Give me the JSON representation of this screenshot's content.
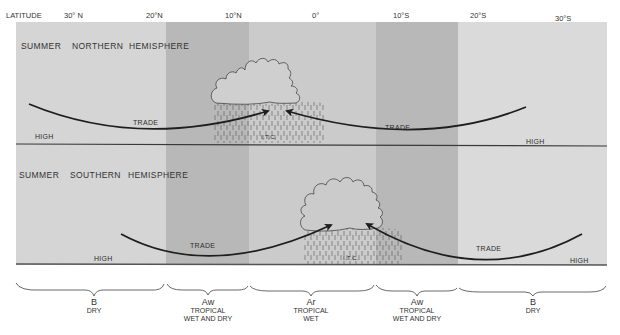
{
  "latitude_axis": {
    "label": "LATITUDE",
    "ticks": [
      "30° N",
      "20°N",
      "10°N",
      "0°",
      "10°S",
      "20°S",
      "30°S"
    ]
  },
  "panels": [
    {
      "title_1": "SUMMER",
      "title_2": "NORTHERN",
      "title_3": "HEMISPHERE",
      "labels": {
        "high_left": "HIGH",
        "trade_left": "TRADE",
        "itc": "I.T.C.",
        "trade_right": "TRADE",
        "high_right": "HIGH"
      }
    },
    {
      "title_1": "SUMMER",
      "title_2": "SOUTHERN",
      "title_3": "HEMISPHERE",
      "labels": {
        "high_left": "HIGH",
        "trade_left": "TRADE",
        "itc": "I.T.C.",
        "trade_right": "TRADE",
        "high_right": "HIGH"
      }
    }
  ],
  "climate_zones": [
    {
      "code": "B",
      "name_1": "DRY",
      "name_2": ""
    },
    {
      "code": "Aw",
      "name_1": "TROPICAL",
      "name_2": "WET AND DRY"
    },
    {
      "code": "Ar",
      "name_1": "TROPICAL",
      "name_2": "WET"
    },
    {
      "code": "Aw",
      "name_1": "TROPICAL",
      "name_2": "WET AND DRY"
    },
    {
      "code": "B",
      "name_1": "DRY",
      "name_2": ""
    }
  ],
  "colors": {
    "dry_band": "#d6d6d6",
    "wet_dry_band": "#b9b9b9",
    "wet_band": "#cacaca",
    "line": "#1e1e1e"
  }
}
